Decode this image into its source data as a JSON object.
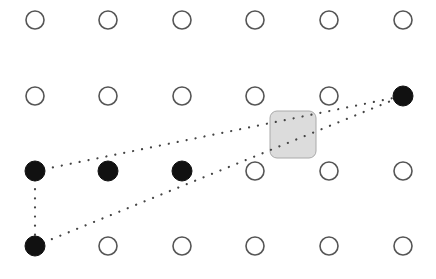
{
  "grid": {
    "columns": [
      35,
      108,
      182,
      255,
      329,
      403
    ],
    "rows": [
      20,
      96,
      171,
      246
    ],
    "radius": 9,
    "stroke_color": "#555555",
    "fill_color": "#111111",
    "selected": [
      [
        0,
        2
      ],
      [
        1,
        2
      ],
      [
        2,
        2
      ],
      [
        5,
        1
      ],
      [
        0,
        3
      ]
    ]
  },
  "paths": [
    {
      "from": [
        35,
        171
      ],
      "to": [
        403,
        96
      ]
    },
    {
      "from": [
        35,
        171
      ],
      "to": [
        35,
        246
      ]
    },
    {
      "from": [
        35,
        246
      ],
      "to": [
        403,
        96
      ]
    }
  ],
  "path_color": "#444444",
  "highlight_box": {
    "x": 270,
    "y": 111,
    "width": 46,
    "height": 47,
    "rx": 7,
    "fill": "#dcdcdc",
    "stroke": "#aaaaaa"
  }
}
